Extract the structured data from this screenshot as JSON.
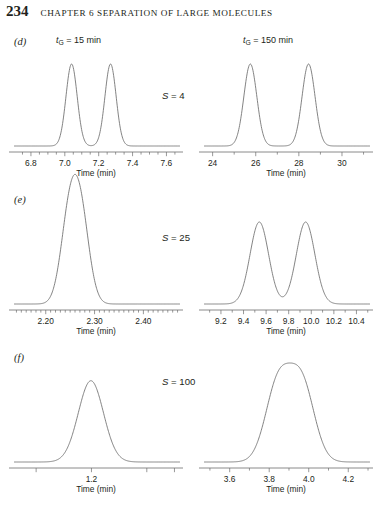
{
  "runhead": {
    "folio": "234",
    "title": "CHAPTER 6   SEPARATION OF LARGE MOLECULES"
  },
  "axis_title": "Time (min)",
  "columns": [
    {
      "gradient_time_label": "= 15 min",
      "symbol": "t",
      "sub": "G"
    },
    {
      "gradient_time_label": "= 150 min",
      "symbol": "t",
      "sub": "G"
    }
  ],
  "panels": [
    {
      "letter": "(d)",
      "s_label": "= 4",
      "s_symbol": "S",
      "left": {
        "tmin": 6.7,
        "tmax": 7.68,
        "ticks_major": [
          "6.8",
          "7.0",
          "7.2",
          "7.4",
          "7.6"
        ],
        "tick_major_values": [
          6.8,
          7.0,
          7.2,
          7.4,
          7.6
        ],
        "tick_minor_values": [
          6.75,
          6.85,
          6.9,
          6.95,
          7.05,
          7.1,
          7.15,
          7.25,
          7.3,
          7.35,
          7.45,
          7.5,
          7.55,
          7.65
        ],
        "peaks": [
          {
            "center": 7.04,
            "height": 1.0,
            "width": 0.033
          },
          {
            "center": 7.27,
            "height": 1.0,
            "width": 0.033
          }
        ]
      },
      "right": {
        "tmin": 23.6,
        "tmax": 31.3,
        "ticks_major": [
          "24",
          "26",
          "28",
          "30"
        ],
        "tick_major_values": [
          24,
          26,
          28,
          30
        ],
        "tick_minor_values": [
          25,
          27,
          29,
          31
        ],
        "peaks": [
          {
            "center": 25.75,
            "height": 1.0,
            "width": 0.3
          },
          {
            "center": 28.45,
            "height": 1.0,
            "width": 0.3
          }
        ]
      }
    },
    {
      "letter": "(e)",
      "s_label": "= 25",
      "s_symbol": "S",
      "left": {
        "tmin": 2.135,
        "tmax": 2.475,
        "ticks_major": [
          "2.20",
          "2.30",
          "2.40"
        ],
        "tick_major_values": [
          2.2,
          2.3,
          2.4
        ],
        "tick_minor_values": [
          2.14,
          2.15,
          2.16,
          2.17,
          2.18,
          2.19,
          2.21,
          2.22,
          2.23,
          2.24,
          2.25,
          2.26,
          2.27,
          2.28,
          2.29,
          2.31,
          2.32,
          2.33,
          2.34,
          2.35,
          2.36,
          2.37,
          2.38,
          2.39,
          2.41,
          2.42,
          2.43,
          2.44,
          2.45,
          2.46,
          2.47
        ],
        "peaks": [
          {
            "center": 2.248,
            "height": 1.0,
            "width": 0.0175
          },
          {
            "center": 2.272,
            "height": 1.0,
            "width": 0.0175
          }
        ]
      },
      "right": {
        "tmin": 9.05,
        "tmax": 10.52,
        "ticks_major": [
          "9.2",
          "9.4",
          "9.6",
          "9.8",
          "10.0",
          "10.2",
          "10.4"
        ],
        "tick_major_values": [
          9.2,
          9.4,
          9.6,
          9.8,
          10.0,
          10.2,
          10.4
        ],
        "tick_minor_values": [
          9.1,
          9.3,
          9.5,
          9.7,
          9.9,
          10.1,
          10.3,
          10.5
        ],
        "peaks": [
          {
            "center": 9.54,
            "height": 1.0,
            "width": 0.082
          },
          {
            "center": 9.95,
            "height": 1.0,
            "width": 0.082
          }
        ]
      }
    },
    {
      "letter": "(f)",
      "s_label": "= 100",
      "s_symbol": "S",
      "left": {
        "tmin": 1.06,
        "tmax": 1.36,
        "ticks_major": [
          "",
          "1.2",
          "",
          ""
        ],
        "tick_major_values": [
          1.1,
          1.2,
          1.3,
          1.35
        ],
        "tick_minor_values": [],
        "peaks": [
          {
            "center": 1.196,
            "height": 0.5,
            "width": 0.0225
          },
          {
            "center": 1.202,
            "height": 0.5,
            "width": 0.0225
          }
        ]
      },
      "right": {
        "tmin": 3.47,
        "tmax": 4.31,
        "ticks_major": [
          "3.6",
          "3.8",
          "4.0",
          "4.2"
        ],
        "tick_major_values": [
          3.6,
          3.8,
          4.0,
          4.2
        ],
        "tick_minor_values": [
          3.5,
          3.7,
          3.9,
          4.1,
          4.3
        ],
        "peaks": [
          {
            "center": 3.845,
            "height": 0.95,
            "width": 0.063
          },
          {
            "center": 3.965,
            "height": 0.95,
            "width": 0.063
          }
        ]
      }
    }
  ],
  "chart_data": {
    "type": "line",
    "xlabel": "Time (min)",
    "ylabel": "Detector response",
    "grid": false,
    "legend": "none",
    "charts": [
      {
        "panel": "(d)",
        "S": 4,
        "gradient_time_min": 15,
        "xlim": [
          6.7,
          7.68
        ],
        "xticks": [
          6.8,
          7.0,
          7.2,
          7.4,
          7.6
        ],
        "peaks": [
          {
            "retention_time": 7.04,
            "relative_height": 1.0,
            "sigma": 0.033
          },
          {
            "retention_time": 7.27,
            "relative_height": 1.0,
            "sigma": 0.033
          }
        ],
        "resolution": "baseline resolved"
      },
      {
        "panel": "(d)",
        "S": 4,
        "gradient_time_min": 150,
        "xlim": [
          23.6,
          31.3
        ],
        "xticks": [
          24,
          26,
          28,
          30
        ],
        "peaks": [
          {
            "retention_time": 25.75,
            "relative_height": 1.0,
            "sigma": 0.3
          },
          {
            "retention_time": 28.45,
            "relative_height": 1.0,
            "sigma": 0.3
          }
        ],
        "resolution": "baseline resolved"
      },
      {
        "panel": "(e)",
        "S": 25,
        "gradient_time_min": 15,
        "xlim": [
          2.135,
          2.475
        ],
        "xticks": [
          2.2,
          2.3,
          2.4
        ],
        "peaks": [
          {
            "retention_time": 2.248,
            "relative_height": 1.0,
            "sigma": 0.0175
          },
          {
            "retention_time": 2.272,
            "relative_height": 1.0,
            "sigma": 0.0175
          }
        ],
        "resolution": "merged, flat-topped single band"
      },
      {
        "panel": "(e)",
        "S": 25,
        "gradient_time_min": 150,
        "xlim": [
          9.05,
          10.52
        ],
        "xticks": [
          9.2,
          9.4,
          9.6,
          9.8,
          10.0,
          10.2,
          10.4
        ],
        "peaks": [
          {
            "retention_time": 9.54,
            "relative_height": 1.0,
            "sigma": 0.082
          },
          {
            "retention_time": 9.95,
            "relative_height": 1.0,
            "sigma": 0.082
          }
        ],
        "resolution": "nearly baseline resolved"
      },
      {
        "panel": "(f)",
        "S": 100,
        "gradient_time_min": 15,
        "xlim": [
          1.06,
          1.36
        ],
        "xticks": [
          1.2
        ],
        "peaks": [
          {
            "retention_time": 1.196,
            "relative_height": 0.5,
            "sigma": 0.0225
          },
          {
            "retention_time": 1.202,
            "relative_height": 0.5,
            "sigma": 0.0225
          }
        ],
        "resolution": "completely merged single peak"
      },
      {
        "panel": "(f)",
        "S": 100,
        "gradient_time_min": 150,
        "xlim": [
          3.47,
          4.31
        ],
        "xticks": [
          3.6,
          3.8,
          4.0,
          4.2
        ],
        "peaks": [
          {
            "retention_time": 3.845,
            "relative_height": 0.95,
            "sigma": 0.063
          },
          {
            "retention_time": 3.965,
            "relative_height": 0.95,
            "sigma": 0.063
          }
        ],
        "resolution": "partially resolved doublet with shallow valley"
      }
    ]
  }
}
